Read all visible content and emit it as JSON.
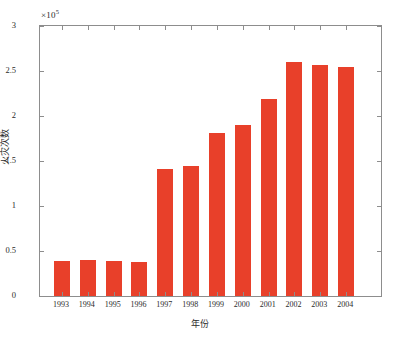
{
  "chart_data": {
    "type": "bar",
    "title": "",
    "subtitle": "",
    "xlabel": "年份",
    "ylabel": "火灾次数",
    "exponent_label": "×10",
    "exponent_power": "5",
    "y_axis_multiplier": 100000,
    "categories": [
      "1993",
      "1994",
      "1995",
      "1996",
      "1997",
      "1998",
      "1999",
      "2000",
      "2001",
      "2002",
      "2003",
      "2004"
    ],
    "values": [
      0.385,
      0.4,
      0.39,
      0.38,
      1.41,
      1.44,
      1.81,
      1.9,
      2.19,
      2.6,
      2.57,
      2.55
    ],
    "yticks": [
      "0",
      "0.5",
      "1",
      "1.5",
      "2",
      "2.5",
      "3"
    ],
    "ytick_values": [
      0,
      0.5,
      1,
      1.5,
      2,
      2.5,
      3
    ],
    "ylim": [
      0,
      3
    ],
    "xlim_categories": 12,
    "grid": false,
    "legend": null,
    "bar_color": "#e8402a",
    "axis_color": "#8d8d8d",
    "background_color": "#ffffff"
  }
}
